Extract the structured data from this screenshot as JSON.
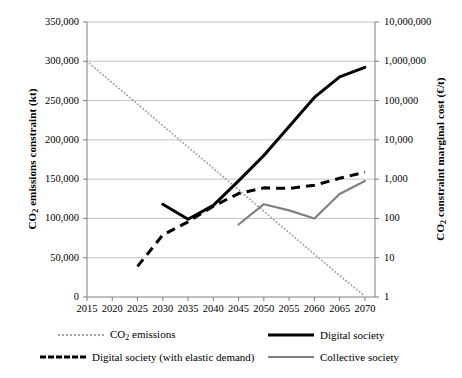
{
  "chart_data": {
    "type": "line",
    "title": "",
    "xlabel": "",
    "ylabel": "CO2 emissions constraint (kt)",
    "ylabel_right": "CO2 constraint marginal cost (€/t)",
    "grid": true,
    "legend_position": "bottom",
    "x": [
      2015,
      2020,
      2025,
      2030,
      2035,
      2040,
      2045,
      2050,
      2055,
      2060,
      2065,
      2070
    ],
    "xlim": [
      2015,
      2072
    ],
    "xticks": [
      "2015",
      "2020",
      "2025",
      "2030",
      "2035",
      "2040",
      "2045",
      "2050",
      "2055",
      "2060",
      "2065",
      "2070"
    ],
    "left_axis": {
      "label": "CO2 emissions constraint (kt)",
      "scale": "linear",
      "ylim": [
        0,
        350000
      ],
      "ticks": [
        0,
        50000,
        100000,
        150000,
        200000,
        250000,
        300000,
        350000
      ],
      "ticklabels": [
        "0",
        "50,000",
        "100,000",
        "150,000",
        "200,000",
        "250,000",
        "300,000",
        "350,000"
      ]
    },
    "right_axis": {
      "label": "CO2 constraint marginal cost (€/t)",
      "scale": "log",
      "ylim": [
        1,
        10000000
      ],
      "ticks": [
        1,
        10,
        100,
        1000,
        10000,
        100000,
        1000000,
        10000000
      ],
      "ticklabels": [
        "1",
        "10",
        "100",
        "1,000",
        "10,000",
        "100,000",
        "1,000,000",
        "10,000,000"
      ]
    },
    "series": [
      {
        "name": "CO2 emissions",
        "axis": "left",
        "style": "dotted",
        "color": "#a6a6a6",
        "x": [
          2015,
          2020,
          2025,
          2030,
          2035,
          2040,
          2045,
          2050,
          2055,
          2060,
          2065,
          2070
        ],
        "values": [
          300000,
          272700,
          245500,
          218200,
          190900,
          163600,
          136400,
          109100,
          81800,
          54500,
          27300,
          1000
        ]
      },
      {
        "name": "Digital society",
        "axis": "right",
        "style": "solid",
        "color": "#000000",
        "x": [
          2030,
          2035,
          2040,
          2045,
          2050,
          2055,
          2060,
          2065,
          2070
        ],
        "values": [
          230,
          95,
          215,
          900,
          4000,
          22000,
          120000,
          400000,
          700000
        ]
      },
      {
        "name": "Digital society (with elastic demand)",
        "axis": "right",
        "style": "dashed",
        "color": "#000000",
        "x": [
          2025,
          2030,
          2035,
          2040,
          2045,
          2050,
          2055,
          2060,
          2065,
          2070
        ],
        "values": [
          6,
          38,
          82,
          205,
          430,
          600,
          580,
          700,
          1050,
          1500
        ]
      },
      {
        "name": "Collective society",
        "axis": "right",
        "style": "solid",
        "color": "#808080",
        "x": [
          2045,
          2050,
          2055,
          2060,
          2065,
          2070
        ],
        "values": [
          70,
          230,
          160,
          100,
          420,
          900
        ]
      }
    ]
  },
  "legend": {
    "items": [
      {
        "label_html": "CO2 emissions",
        "style": "dotted",
        "color": "#a6a6a6"
      },
      {
        "label_html": "Digital society",
        "style": "solid",
        "color": "#000000"
      },
      {
        "label_html": "Digital society (with elastic demand)",
        "style": "dashed",
        "color": "#000000"
      },
      {
        "label_html": "Collective society",
        "style": "solid",
        "color": "#808080"
      }
    ]
  }
}
